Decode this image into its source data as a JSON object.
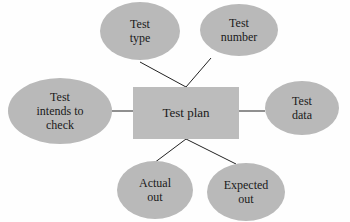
{
  "diagram": {
    "type": "mind-map",
    "center": {
      "id": "test-plan",
      "label": "Test plan"
    },
    "nodes": [
      {
        "id": "test-type",
        "label": "Test\ntype"
      },
      {
        "id": "test-number",
        "label": "Test\nnumber"
      },
      {
        "id": "test-intends-to-check",
        "label": "Test\nintends to\ncheck"
      },
      {
        "id": "test-data",
        "label": "Test\ndata"
      },
      {
        "id": "actual-out",
        "label": "Actual\nout"
      },
      {
        "id": "expected-out",
        "label": "Expected\nout"
      }
    ],
    "edges": [
      {
        "from": "test-plan",
        "to": "test-type"
      },
      {
        "from": "test-plan",
        "to": "test-number"
      },
      {
        "from": "test-plan",
        "to": "test-intends-to-check"
      },
      {
        "from": "test-plan",
        "to": "test-data"
      },
      {
        "from": "test-plan",
        "to": "actual-out"
      },
      {
        "from": "test-plan",
        "to": "expected-out"
      }
    ],
    "colors": {
      "node_fill": "#b9b9b9",
      "center_fill": "#bcbcbc",
      "line": "#222222",
      "text": "#1a1a1a",
      "background": "#fefefe"
    }
  }
}
